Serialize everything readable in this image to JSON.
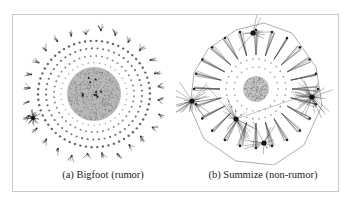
{
  "figure": {
    "panels": [
      {
        "label": "(a)",
        "caption": "(a) Bigfoot (rumor)",
        "title": "Bigfoot",
        "class": "rumor"
      },
      {
        "label": "(b)",
        "caption": "(b) Summize (non-rumor)",
        "title": "Summize",
        "class": "non-rumor"
      }
    ]
  }
}
